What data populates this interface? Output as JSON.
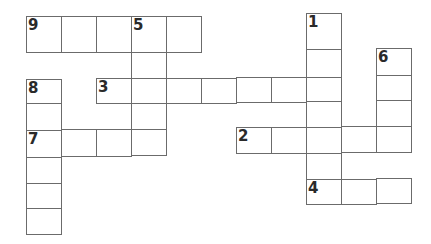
{
  "puzzle": {
    "type": "crossword",
    "line_color": "#6b6b6b",
    "number_color": "#2a2a2a",
    "clue_numbers": [
      "1",
      "2",
      "3",
      "4",
      "5",
      "6",
      "7",
      "8",
      "9"
    ],
    "cells": [
      {
        "id": "c9-1",
        "x": 26,
        "y": 16,
        "w": 35,
        "h": 36,
        "num": "9"
      },
      {
        "id": "c9-2",
        "x": 61,
        "y": 16,
        "w": 35,
        "h": 36,
        "num": ""
      },
      {
        "id": "c9-3",
        "x": 96,
        "y": 16,
        "w": 35,
        "h": 36,
        "num": ""
      },
      {
        "id": "c9-4",
        "x": 131,
        "y": 16,
        "w": 35,
        "h": 36,
        "num": "5"
      },
      {
        "id": "c9-5",
        "x": 166,
        "y": 16,
        "w": 35,
        "h": 36,
        "num": ""
      },
      {
        "id": "c5-2",
        "x": 131,
        "y": 52,
        "w": 35,
        "h": 26,
        "num": ""
      },
      {
        "id": "c8-1",
        "x": 26,
        "y": 79,
        "w": 35,
        "h": 24,
        "num": "8"
      },
      {
        "id": "c8-2",
        "x": 26,
        "y": 103,
        "w": 35,
        "h": 27,
        "num": ""
      },
      {
        "id": "c3-1",
        "x": 96,
        "y": 78,
        "w": 35,
        "h": 25,
        "num": "3"
      },
      {
        "id": "c3-2",
        "x": 131,
        "y": 78,
        "w": 35,
        "h": 25,
        "num": ""
      },
      {
        "id": "c3-3",
        "x": 166,
        "y": 78,
        "w": 35,
        "h": 25,
        "num": ""
      },
      {
        "id": "c3-4",
        "x": 201,
        "y": 78,
        "w": 35,
        "h": 25,
        "num": ""
      },
      {
        "id": "c3-5",
        "x": 236,
        "y": 77,
        "w": 35,
        "h": 25,
        "num": ""
      },
      {
        "id": "c3-6",
        "x": 271,
        "y": 77,
        "w": 35,
        "h": 25,
        "num": ""
      },
      {
        "id": "c3-7",
        "x": 306,
        "y": 76,
        "w": 35,
        "h": 25,
        "num": ""
      },
      {
        "id": "c5-4",
        "x": 131,
        "y": 103,
        "w": 35,
        "h": 26,
        "num": ""
      },
      {
        "id": "c7-1",
        "x": 26,
        "y": 130,
        "w": 35,
        "h": 27,
        "num": "7"
      },
      {
        "id": "c7-2",
        "x": 61,
        "y": 129,
        "w": 35,
        "h": 27,
        "num": ""
      },
      {
        "id": "c7-3",
        "x": 96,
        "y": 129,
        "w": 35,
        "h": 27,
        "num": ""
      },
      {
        "id": "c7-4",
        "x": 131,
        "y": 129,
        "w": 35,
        "h": 26,
        "num": ""
      },
      {
        "id": "c8-4",
        "x": 26,
        "y": 157,
        "w": 35,
        "h": 26,
        "num": ""
      },
      {
        "id": "c8-5",
        "x": 26,
        "y": 183,
        "w": 35,
        "h": 25,
        "num": ""
      },
      {
        "id": "c8-6",
        "x": 26,
        "y": 208,
        "w": 35,
        "h": 26,
        "num": ""
      },
      {
        "id": "c1-1",
        "x": 306,
        "y": 13,
        "w": 35,
        "h": 37,
        "num": "1"
      },
      {
        "id": "c1-2",
        "x": 306,
        "y": 49,
        "w": 35,
        "h": 28,
        "num": ""
      },
      {
        "id": "c1-4",
        "x": 306,
        "y": 101,
        "w": 35,
        "h": 27,
        "num": ""
      },
      {
        "id": "c1-6",
        "x": 306,
        "y": 153,
        "w": 35,
        "h": 27,
        "num": ""
      },
      {
        "id": "c6-1",
        "x": 376,
        "y": 48,
        "w": 35,
        "h": 28,
        "num": "6"
      },
      {
        "id": "c6-2",
        "x": 376,
        "y": 75,
        "w": 35,
        "h": 26,
        "num": ""
      },
      {
        "id": "c6-3",
        "x": 376,
        "y": 100,
        "w": 35,
        "h": 27,
        "num": ""
      },
      {
        "id": "c2-1",
        "x": 236,
        "y": 127,
        "w": 35,
        "h": 26,
        "num": "2"
      },
      {
        "id": "c2-2",
        "x": 271,
        "y": 127,
        "w": 35,
        "h": 26,
        "num": ""
      },
      {
        "id": "c2-3",
        "x": 306,
        "y": 127,
        "w": 35,
        "h": 26,
        "num": ""
      },
      {
        "id": "c2-4",
        "x": 341,
        "y": 126,
        "w": 35,
        "h": 26,
        "num": ""
      },
      {
        "id": "c2-5",
        "x": 376,
        "y": 126,
        "w": 35,
        "h": 26,
        "num": ""
      },
      {
        "id": "c4-1",
        "x": 306,
        "y": 179,
        "w": 35,
        "h": 25,
        "num": "4"
      },
      {
        "id": "c4-2",
        "x": 341,
        "y": 179,
        "w": 35,
        "h": 25,
        "num": ""
      },
      {
        "id": "c4-3",
        "x": 376,
        "y": 178,
        "w": 35,
        "h": 25,
        "num": ""
      }
    ]
  }
}
